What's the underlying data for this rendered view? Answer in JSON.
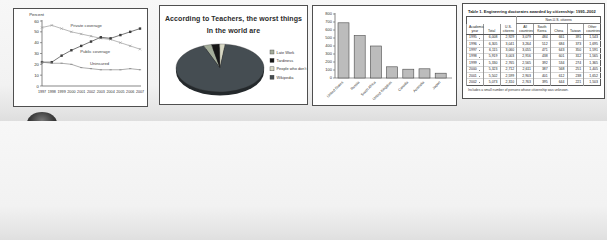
{
  "chart_data": [
    {
      "type": "line",
      "ylabel": "Percent",
      "ylim": [
        0,
        60
      ],
      "ytick_step": 10,
      "grid": false,
      "categories": [
        "1997",
        "1998",
        "1999",
        "2000",
        "2001",
        "2002",
        "2003",
        "2004",
        "2005",
        "2006",
        "2007"
      ],
      "series": [
        {
          "name": "Private coverage",
          "values": [
            54,
            56,
            53,
            50,
            48,
            46,
            44,
            43,
            40,
            37,
            34
          ],
          "color": "#9a9a9a",
          "marker": "x",
          "label_index": 3,
          "label_dy": -5
        },
        {
          "name": "Public coverage",
          "values": [
            22,
            22,
            28,
            33,
            37,
            41,
            45,
            44,
            47,
            50,
            53
          ],
          "color": "#3d3d3d",
          "marker": "square",
          "label_index": 4,
          "label_dy": 7
        },
        {
          "name": "Uninsured",
          "values": [
            22,
            21,
            21,
            20,
            17,
            16,
            15,
            15,
            15,
            16,
            15
          ],
          "color": "#8a8a8a",
          "marker": "tick",
          "label_index": 5,
          "label_dy": -4
        }
      ]
    },
    {
      "type": "pie",
      "title_line1": "According to Teachers, the worst things",
      "title_line2": "In the world are",
      "start_angle_deg": -112,
      "legend_position": "right",
      "slices": [
        {
          "label": "Late Work",
          "value": 3,
          "color": "#a4ad9a"
        },
        {
          "label": "Tardiness",
          "value": 3,
          "color": "#161616"
        },
        {
          "label": "People who don't try",
          "value": 2,
          "color": "#d8d8c4"
        },
        {
          "label": "Wikipedia",
          "value": 92,
          "color": "#454d52"
        }
      ]
    },
    {
      "type": "bar",
      "ylim": [
        0,
        800
      ],
      "ytick_step": 100,
      "grid": false,
      "bar_color": "#bcbcbc",
      "bar_border": "#4a4a4a",
      "categories": [
        "United States",
        "Russia",
        "South Africa",
        "United Kingdom",
        "Canada",
        "Australia",
        "Japan"
      ],
      "values": [
        690,
        530,
        400,
        140,
        110,
        115,
        60
      ]
    },
    {
      "type": "table",
      "title": "Table 1. Engineering doctorates awarded by citizenship: 1995–2002",
      "group_header": "Non-U.S. citizens",
      "columns": [
        "Academic year",
        "Total",
        "U.S. citizens",
        "All countries",
        "South Korea",
        "China",
        "Taiwan",
        "Other countries"
      ],
      "rows": [
        [
          "1995",
          "6,008",
          "2,929",
          "3,079",
          "484",
          "661",
          "391",
          "1,543"
        ],
        [
          "1996",
          "6,305",
          "3,041",
          "3,264",
          "512",
          "684",
          "373",
          "1,695"
        ],
        [
          "1997",
          "6,115",
          "3,060",
          "3,055",
          "471",
          "643",
          "350",
          "1,591"
        ],
        [
          "1998",
          "5,919",
          "3,003",
          "2,916",
          "438",
          "601",
          "312",
          "1,565"
        ],
        [
          "1999",
          "5,330",
          "2,765",
          "2,565",
          "392",
          "534",
          "274",
          "1,365"
        ],
        [
          "2000",
          "5,323",
          "2,712",
          "2,611",
          "387",
          "568",
          "251",
          "1,405"
        ],
        [
          "2001",
          "5,502",
          "2,599",
          "2,903",
          "401",
          "612",
          "238",
          "1,652"
        ],
        [
          "2002",
          "5,073",
          "2,310",
          "2,763",
          "395",
          "644",
          "221",
          "1,503"
        ]
      ],
      "footnote": "Includes a small number of persons whose citizenship was unknown."
    }
  ]
}
